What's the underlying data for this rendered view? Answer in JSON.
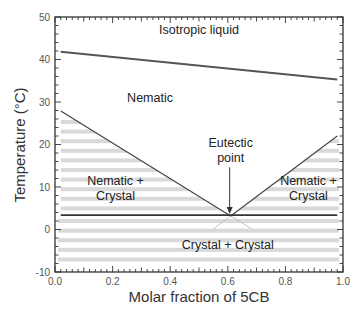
{
  "chart_data": {
    "type": "line",
    "title": "",
    "xlabel": "Molar fraction of 5CB",
    "ylabel": "Temperature (°C)",
    "xlim": [
      0.0,
      1.0
    ],
    "ylim": [
      -10,
      50
    ],
    "x_ticks": [
      0.0,
      0.2,
      0.4,
      0.6,
      0.8,
      1.0
    ],
    "x_tick_labels": [
      "0.0",
      "0.2",
      "0.4",
      "0.6",
      "0.8",
      "1.0"
    ],
    "y_ticks": [
      -10,
      0,
      10,
      20,
      30,
      40,
      50
    ],
    "y_tick_labels": [
      "-10",
      "0",
      "10",
      "20",
      "30",
      "40",
      "50"
    ],
    "grid": false,
    "legend": null,
    "series": [
      {
        "name": "Isotropic-nematic transition",
        "x": [
          0.02,
          0.98
        ],
        "y": [
          41.8,
          35.3
        ],
        "color": "#555555"
      },
      {
        "name": "Left liquidus",
        "x": [
          0.02,
          0.61
        ],
        "y": [
          27.9,
          3.2
        ],
        "color": "#444444"
      },
      {
        "name": "Right liquidus",
        "x": [
          0.61,
          0.98
        ],
        "y": [
          3.2,
          22.0
        ],
        "color": "#444444"
      },
      {
        "name": "Eutectic line",
        "x": [
          0.02,
          0.98
        ],
        "y": [
          3.4,
          3.4
        ],
        "color": "#333333"
      }
    ],
    "eutectic_point": {
      "x": 0.61,
      "y": 3.2
    },
    "regions": [
      {
        "label": "Isotropic liquid",
        "x": 0.5,
        "y": 46
      },
      {
        "label": "Nematic",
        "x": 0.33,
        "y": 30
      },
      {
        "label": "Nematic +",
        "x": 0.21,
        "y": 10.5
      },
      {
        "label": "Crystal",
        "x": 0.21,
        "y": 7
      },
      {
        "label": "Nematic +",
        "x": 0.88,
        "y": 10.5
      },
      {
        "label": "Crystal",
        "x": 0.88,
        "y": 7
      },
      {
        "label": "Crystal + Crystal",
        "x": 0.6,
        "y": -4.5
      }
    ],
    "annotations": [
      {
        "text": "Eutectic",
        "x": 0.61,
        "y": 19.5
      },
      {
        "text": "point",
        "x": 0.61,
        "y": 15.8
      }
    ],
    "colors": {
      "axis": "#333333",
      "stripe": "#d9d9d9",
      "ghost_lines": "#bbbbbb"
    }
  }
}
